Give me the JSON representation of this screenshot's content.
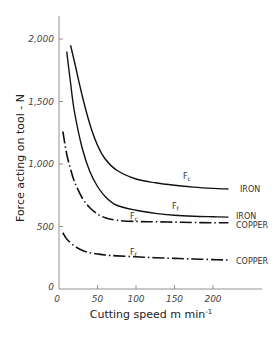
{
  "chart_data": {
    "type": "line",
    "title": "",
    "xlabel": "Cutting speed  m min⁻¹",
    "ylabel": "Force acting on tool - N",
    "xlim": [
      0,
      240
    ],
    "ylim": [
      0,
      2200
    ],
    "grid": false,
    "legend": "none (curves labelled inline)",
    "x_ticks": [
      "0",
      "50",
      "100",
      "150",
      "200"
    ],
    "y_ticks": [
      "0",
      "500",
      "1,000",
      "1,500",
      "2,000"
    ],
    "series": [
      {
        "name": "Fc IRON",
        "label": "Fc",
        "material": "IRON",
        "style": "solid",
        "x": [
          15,
          20,
          30,
          40,
          50,
          60,
          75,
          100,
          125,
          150,
          175,
          200,
          220
        ],
        "y": [
          1950,
          1820,
          1550,
          1320,
          1150,
          1040,
          950,
          880,
          850,
          830,
          815,
          805,
          800
        ]
      },
      {
        "name": "Ff IRON",
        "label": "Ff",
        "material": "IRON",
        "style": "solid",
        "x": [
          10,
          15,
          20,
          30,
          40,
          50,
          60,
          75,
          100,
          125,
          150,
          175,
          200,
          220
        ],
        "y": [
          1900,
          1650,
          1420,
          1130,
          940,
          820,
          740,
          670,
          630,
          605,
          590,
          582,
          578,
          575
        ]
      },
      {
        "name": "Fc COPPER",
        "label": "Fc",
        "material": "COPPER",
        "style": "dash-dot",
        "x": [
          5,
          10,
          15,
          20,
          30,
          40,
          50,
          60,
          75,
          100,
          125,
          150,
          175,
          200,
          220
        ],
        "y": [
          1260,
          1080,
          960,
          860,
          730,
          650,
          600,
          570,
          550,
          540,
          538,
          535,
          532,
          530,
          530
        ]
      },
      {
        "name": "Ff COPPER",
        "label": "Ff",
        "material": "COPPER",
        "style": "dash-dot",
        "x": [
          5,
          10,
          20,
          30,
          40,
          50,
          60,
          75,
          100,
          125,
          150,
          175,
          200,
          220
        ],
        "y": [
          450,
          400,
          345,
          310,
          290,
          280,
          272,
          265,
          258,
          250,
          245,
          240,
          235,
          232
        ]
      }
    ],
    "annotations": [
      {
        "text": "Fc",
        "near": "Fc IRON curve",
        "x": 165,
        "y": 870
      },
      {
        "text": "IRON",
        "at_end_of": "Fc IRON"
      },
      {
        "text": "Ff",
        "near": "Ff IRON curve",
        "x": 135,
        "y": 690
      },
      {
        "text": "IRON",
        "at_end_of": "Ff IRON"
      },
      {
        "text": "Fc",
        "near": "Fc COPPER curve",
        "x": 100,
        "y": 590
      },
      {
        "text": "COPPER",
        "at_end_of": "Fc COPPER"
      },
      {
        "text": "Ff",
        "near": "Ff COPPER curve",
        "x": 100,
        "y": 310
      },
      {
        "text": "COPPER",
        "at_end_of": "Ff COPPER"
      }
    ]
  },
  "labels": {
    "ylabel": "Force acting on tool - N",
    "xlabel": "Cutting speed  m min",
    "xlabel_sup": "-1",
    "fc_main": "F",
    "fc_sub": "c",
    "ff_main": "F",
    "ff_sub": "f",
    "iron": "IRON",
    "copper": "COPPER"
  }
}
